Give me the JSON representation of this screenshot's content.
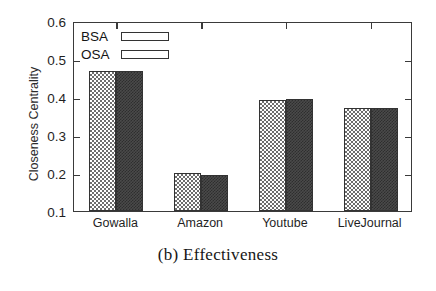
{
  "chart_data": {
    "type": "bar",
    "title": "",
    "caption": "(b) Effectiveness",
    "xlabel": "",
    "ylabel": "Closeness Centrality",
    "categories": [
      "Gowalla",
      "Amazon",
      "Youtube",
      "LiveJournal"
    ],
    "series": [
      {
        "name": "BSA",
        "values": [
          0.468,
          0.199,
          0.392,
          0.372
        ]
      },
      {
        "name": "OSA",
        "values": [
          0.468,
          0.196,
          0.394,
          0.372
        ]
      }
    ],
    "ylim": [
      0.1,
      0.6
    ],
    "yticks": [
      0.1,
      0.2,
      0.3,
      0.4,
      0.5,
      0.6
    ],
    "ytick_labels": [
      "0.1",
      "0.2",
      "0.3",
      "0.4",
      "0.5",
      "0.6"
    ],
    "grid": false,
    "legend_position": "top-left",
    "legend": [
      "BSA",
      "OSA"
    ],
    "colors": {
      "bsa_fill": "#ffffff",
      "bsa_hatch": "#6e6e6e",
      "osa_fill": "#4a4a4a",
      "osa_hatch": "#2e2e2e",
      "axis": "#3a3a3a",
      "text": "#1f1f1f"
    }
  }
}
